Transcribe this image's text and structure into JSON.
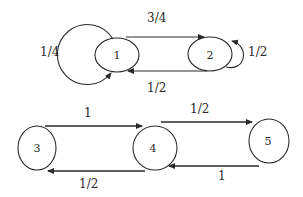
{
  "diagram": {
    "type": "markov-chain-state-diagram",
    "nodes": [
      {
        "id": "1",
        "label": "1"
      },
      {
        "id": "2",
        "label": "2"
      },
      {
        "id": "3",
        "label": "3"
      },
      {
        "id": "4",
        "label": "4"
      },
      {
        "id": "5",
        "label": "5"
      }
    ],
    "edges": [
      {
        "from": "1",
        "to": "1",
        "label": "1/4"
      },
      {
        "from": "1",
        "to": "2",
        "label": "3/4"
      },
      {
        "from": "2",
        "to": "1",
        "label": "1/2"
      },
      {
        "from": "2",
        "to": "2",
        "label": "1/2"
      },
      {
        "from": "3",
        "to": "4",
        "label": "1"
      },
      {
        "from": "4",
        "to": "3",
        "label": "1/2"
      },
      {
        "from": "4",
        "to": "5",
        "label": "1/2"
      },
      {
        "from": "5",
        "to": "4",
        "label": "1"
      }
    ]
  }
}
